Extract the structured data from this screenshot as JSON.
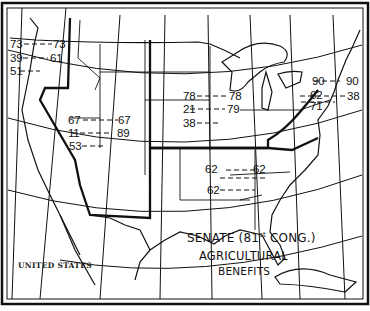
{
  "map": {
    "title_lines": [
      "SENATE (81st CONG.)",
      "AGRICULTURAL",
      "BENEFITS"
    ],
    "title": {
      "line1": "SENATE (81",
      "sup": "st",
      "line1b": " CONG.)",
      "line2": "AGRICULTURAL",
      "line3": "BENEFITS"
    },
    "country_label": "UNITED STATES",
    "region_figures": {
      "pacific_northwest": {
        "rows": [
          {
            "left": "73",
            "right": "73"
          },
          {
            "left": "39",
            "right": "61"
          },
          {
            "left": "51",
            "right": ""
          }
        ]
      },
      "mountain_west": {
        "rows": [
          {
            "left": "67",
            "right": "67"
          },
          {
            "left": "11",
            "right": "89"
          },
          {
            "left": "53",
            "right": ""
          }
        ]
      },
      "midwest": {
        "rows": [
          {
            "left": "78",
            "right": "78"
          },
          {
            "left": "21",
            "right": "79"
          },
          {
            "left": "38",
            "right": ""
          }
        ]
      },
      "northeast": {
        "rows": [
          {
            "left": "90",
            "right": "90"
          },
          {
            "left": "62",
            "right": "38"
          },
          {
            "left": "71",
            "right": ""
          }
        ]
      },
      "south": {
        "rows": [
          {
            "left": "62",
            "right": "62"
          },
          {
            "left": "62",
            "right": ""
          }
        ]
      }
    },
    "colors": {
      "ink": "#111111",
      "paper": "#ffffff"
    }
  }
}
